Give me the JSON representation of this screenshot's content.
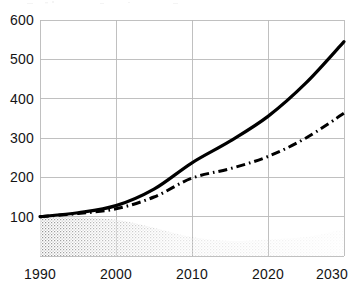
{
  "chart_data": {
    "type": "line",
    "title": "",
    "subtitle": "",
    "xlabel": "",
    "ylabel": "",
    "x": [
      1990,
      1995,
      2000,
      2005,
      2010,
      2015,
      2020,
      2025,
      2030
    ],
    "xlim": [
      1990,
      2030
    ],
    "ylim": [
      0,
      600
    ],
    "xticks": [
      "1990",
      "2000",
      "2010",
      "2020",
      "2030"
    ],
    "yticks": [
      "100",
      "200",
      "300",
      "400",
      "500",
      "600"
    ],
    "grid": true,
    "legend": "none",
    "index_base": 100,
    "series": [
      {
        "name": "solid-curve",
        "style": "solid",
        "color": "#000000",
        "width": 3.2,
        "values": [
          100,
          110,
          128,
          170,
          237,
          292,
          355,
          440,
          545
        ]
      },
      {
        "name": "dash-dot-curve",
        "style": "dash-dot",
        "color": "#000000",
        "width": 3.0,
        "values": [
          100,
          108,
          120,
          150,
          198,
          222,
          253,
          300,
          363
        ]
      },
      {
        "name": "stippled-band",
        "style": "stipple-fill",
        "color": "#9a9a9a",
        "width": 0,
        "values": [
          100,
          98,
          92,
          72,
          48,
          38,
          42,
          48,
          68
        ]
      }
    ],
    "annotations": []
  },
  "axis": {
    "y_tick_labels": [
      "600",
      "500",
      "400",
      "300",
      "200",
      "100"
    ],
    "x_tick_labels": [
      "1990",
      "2000",
      "2010",
      "2020",
      "2030"
    ]
  }
}
